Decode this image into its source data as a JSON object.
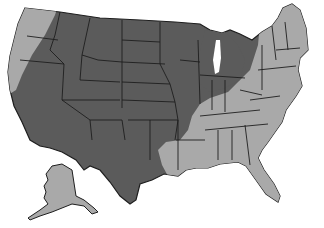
{
  "map": {
    "title": "United States regional shading map",
    "colors": {
      "dark_region": "#5b5b5b",
      "light_region": "#a9a9a9",
      "border": "#1e1e1e",
      "water": "#ffffff"
    },
    "legend": {
      "dark_label": "Interior / western and central region",
      "light_label": "Coastal / eastern and southern region"
    },
    "caption": "",
    "insets": [
      "Alaska"
    ]
  }
}
